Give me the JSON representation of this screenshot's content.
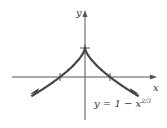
{
  "chart_data": {
    "type": "line",
    "title": "",
    "xlabel": "x",
    "ylabel": "y",
    "annotation": "y = 1 − x^{2/3}",
    "equation_parts": {
      "lhs": "y = 1 − x",
      "exp": "2/3"
    },
    "x_ticks": [
      -1,
      1
    ],
    "y_ticks": [
      1
    ],
    "series": [
      {
        "name": "y = 1 - x^(2/3)",
        "x": [
          -2.2,
          -1.5,
          -1,
          -0.5,
          -0.1,
          0,
          0.1,
          0.5,
          1,
          1.5,
          2.2
        ],
        "y": [
          -0.69,
          -0.31,
          0,
          0.37,
          0.78,
          1,
          0.78,
          0.37,
          0,
          -0.31,
          -0.69
        ]
      }
    ],
    "grid": false
  },
  "labels": {
    "x": "x",
    "y": "y",
    "eq": "y = 1 − x",
    "exp": "2/3"
  }
}
